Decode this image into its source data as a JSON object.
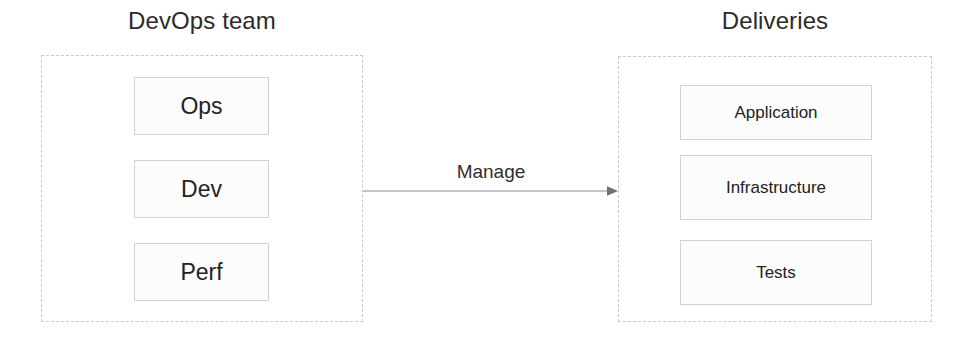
{
  "diagram": {
    "title_left": "DevOps team",
    "title_right": "Deliveries",
    "groups": [
      {
        "id": "devops-team",
        "label": "DevOps team",
        "items": [
          {
            "label": "Ops"
          },
          {
            "label": "Dev"
          },
          {
            "label": "Perf"
          }
        ]
      },
      {
        "id": "deliveries",
        "label": "Deliveries",
        "items": [
          {
            "label": "Application"
          },
          {
            "label": "Infrastructure"
          },
          {
            "label": "Tests"
          }
        ]
      }
    ],
    "connector": {
      "label": "Manage",
      "from": "devops-team",
      "to": "deliveries",
      "arrow": "arrow-right-icon"
    },
    "colors": {
      "group_border": "#c9c9c9",
      "item_border": "#d2d2d2",
      "item_fill": "#fcfcfc",
      "text": "#232323",
      "connector_line": "#8a8a8a",
      "background": "#ffffff"
    }
  }
}
